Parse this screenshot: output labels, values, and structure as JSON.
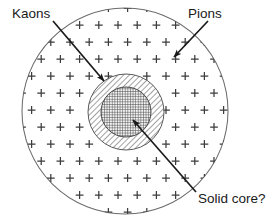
{
  "figure": {
    "background_color": "#ffffff",
    "line_color": "#4a4a4a",
    "arrow_color": "#1a1a1a",
    "text_color": "#1a1a1a"
  },
  "labels": {
    "kaons": "Kaons",
    "pions": "Pions",
    "solid_core": "Solid core?"
  },
  "regions": [
    {
      "name": "pion-region",
      "label": "Pions",
      "shape": "circle",
      "cx": 125,
      "cy": 111,
      "r": 103,
      "fill": "none",
      "marker": "+"
    },
    {
      "name": "kaon-shell",
      "label": "Kaons",
      "shape": "annulus",
      "cx": 126,
      "cy": 112,
      "r": 38,
      "fill": "diagonal-hatch"
    },
    {
      "name": "solid-core",
      "label": "Solid core?",
      "shape": "circle",
      "cx": 126,
      "cy": 112,
      "r": 25,
      "fill": "cross-hatch"
    }
  ],
  "annotations": [
    {
      "name": "kaons-arrow",
      "label": "Kaons",
      "label_x": 12,
      "label_y": 18,
      "x1": 53,
      "y1": 21,
      "x2": 104,
      "y2": 81
    },
    {
      "name": "pions-arrow",
      "label": "Pions",
      "label_x": 188,
      "label_y": 18,
      "x1": 208,
      "y1": 21,
      "x2": 174,
      "y2": 57
    },
    {
      "name": "solid-core-arrow",
      "label": "Solid core?",
      "label_x": 198,
      "label_y": 203,
      "x1": 196,
      "y1": 192,
      "x2": 133,
      "y2": 120
    }
  ],
  "chart_data": {
    "type": "diagram",
    "layers": [
      {
        "name": "Pions",
        "radius": 103,
        "fill": "plus-markers",
        "order": 1
      },
      {
        "name": "Kaons",
        "radius": 38,
        "fill": "diagonal-hatch",
        "order": 2
      },
      {
        "name": "Solid core?",
        "radius": 25,
        "fill": "cross-hatch",
        "order": 3
      }
    ],
    "center": [
      125,
      111
    ],
    "marker_symbol": "+",
    "marker_count": 57,
    "legend": [
      "Kaons",
      "Pions",
      "Solid core?"
    ]
  }
}
